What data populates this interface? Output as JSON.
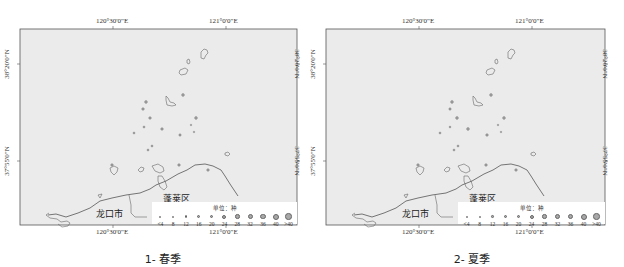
{
  "figure": {
    "panels": [
      {
        "id": "spring",
        "caption": "1- 春季",
        "lon_ticks": [
          "120°30'0\"E",
          "121°0'0\"E"
        ],
        "lat_ticks": [
          "38°20'0\"N",
          "37°55'0\"N"
        ],
        "places": {
          "city": "龙口市",
          "district": "蓬莱区"
        },
        "legend": {
          "title": "单位：种",
          "classes": [
            "<4",
            "8",
            "12",
            "16",
            "20",
            "24",
            "28",
            "32",
            "36",
            "40",
            ">40"
          ]
        }
      },
      {
        "id": "summer",
        "caption": "2- 夏季",
        "lon_ticks": [
          "120°30'0\"E",
          "121°0'0\"E"
        ],
        "lat_ticks": [
          "38°20'0\"N",
          "37°55'0\"N"
        ],
        "places": {
          "city": "龙口市",
          "district": "蓬莱区"
        },
        "legend": {
          "title": "单位：种",
          "classes": [
            "<4",
            "8",
            "12",
            "16",
            "20",
            "24",
            "28",
            "32",
            "36",
            "40",
            ">40"
          ]
        }
      }
    ]
  },
  "colors": {
    "map_background": "#ebebeb",
    "frame": "#555555",
    "coastline": "#555555",
    "point_fill": "#a0a0a0"
  }
}
